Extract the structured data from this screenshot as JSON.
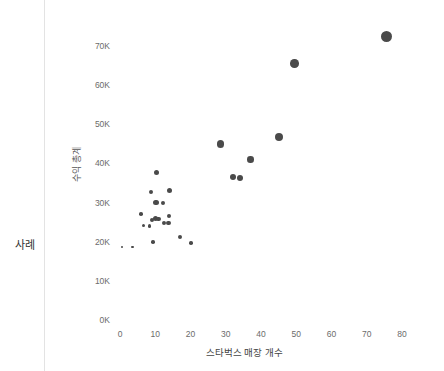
{
  "shelf": {
    "row_label": "사례"
  },
  "chart_data": {
    "type": "scatter",
    "title": "",
    "xlabel": "스타벅스 매장 개수",
    "ylabel": "수익 총계",
    "xlim": [
      0,
      80
    ],
    "ylim": [
      0,
      75000
    ],
    "grid": false,
    "legend": "none",
    "mark_color": "#4a4a4a",
    "x_ticks": [
      0,
      10,
      20,
      30,
      40,
      50,
      60,
      70,
      80
    ],
    "x_tick_labels": [
      "0",
      "10",
      "20",
      "30",
      "40",
      "50",
      "60",
      "70",
      "80"
    ],
    "y_ticks": [
      0,
      10000,
      20000,
      30000,
      40000,
      50000,
      60000,
      70000
    ],
    "y_tick_labels": [
      "0K",
      "10K",
      "20K",
      "30K",
      "40K",
      "50K",
      "60K",
      "70K"
    ],
    "points": [
      {
        "x": 75.5,
        "y": 72500,
        "size": 11
      },
      {
        "x": 49.5,
        "y": 65500,
        "size": 8.5
      },
      {
        "x": 45.0,
        "y": 46800,
        "size": 8
      },
      {
        "x": 28.5,
        "y": 45000,
        "size": 7.5
      },
      {
        "x": 37.0,
        "y": 41000,
        "size": 6.5
      },
      {
        "x": 32.0,
        "y": 36500,
        "size": 6
      },
      {
        "x": 34.0,
        "y": 36400,
        "size": 6
      },
      {
        "x": 10.3,
        "y": 37800,
        "size": 5
      },
      {
        "x": 14.0,
        "y": 33000,
        "size": 5
      },
      {
        "x": 8.8,
        "y": 32600,
        "size": 4
      },
      {
        "x": 10.2,
        "y": 30000,
        "size": 5.5
      },
      {
        "x": 12.3,
        "y": 30000,
        "size": 4
      },
      {
        "x": 6.0,
        "y": 27100,
        "size": 3.5
      },
      {
        "x": 13.8,
        "y": 26600,
        "size": 4
      },
      {
        "x": 10.0,
        "y": 25900,
        "size": 5
      },
      {
        "x": 10.9,
        "y": 25800,
        "size": 4.5
      },
      {
        "x": 9.0,
        "y": 25600,
        "size": 4
      },
      {
        "x": 13.7,
        "y": 24800,
        "size": 4.5
      },
      {
        "x": 12.6,
        "y": 24700,
        "size": 4
      },
      {
        "x": 6.6,
        "y": 24200,
        "size": 3.5
      },
      {
        "x": 8.3,
        "y": 24000,
        "size": 3.5
      },
      {
        "x": 17.0,
        "y": 21300,
        "size": 4
      },
      {
        "x": 9.4,
        "y": 19900,
        "size": 3.5
      },
      {
        "x": 20.2,
        "y": 19700,
        "size": 3.5
      },
      {
        "x": 0.6,
        "y": 18700,
        "size": 2.6
      },
      {
        "x": 3.6,
        "y": 18700,
        "size": 2.6
      }
    ]
  }
}
